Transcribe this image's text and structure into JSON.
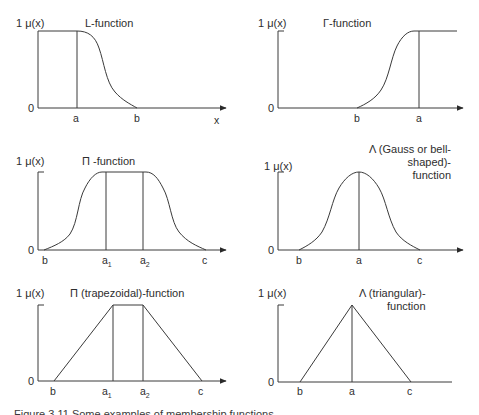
{
  "figure": {
    "caption": "Figure 3.11  Some examples of membership functions"
  },
  "panels": [
    {
      "id": "L",
      "title": "L-function",
      "y_label": "1 μ(x)",
      "zero_label": "0",
      "x_label": "x",
      "ticks": [
        "a",
        "b"
      ]
    },
    {
      "id": "Gamma",
      "title": "Γ-function",
      "y_label": "1 μ(x)",
      "zero_label": "0",
      "ticks": [
        "b",
        "a"
      ]
    },
    {
      "id": "Pi",
      "title": "Π -function",
      "y_label": "1 μ(x)",
      "zero_label": "0",
      "ticks": [
        "b",
        "a",
        "1",
        "a",
        "2",
        "c"
      ]
    },
    {
      "id": "Gauss",
      "title_lines": [
        "Λ (Gauss or bell-",
        "shaped)-",
        "function"
      ],
      "y_label": "1 μ(x)",
      "zero_label": "0",
      "ticks": [
        "b",
        "a",
        "c"
      ]
    },
    {
      "id": "Trapezoid",
      "title": "Π (trapezoidal)-function",
      "y_label": "1 μ(x)",
      "zero_label": "0",
      "ticks": [
        "b",
        "a",
        "1",
        "a",
        "2",
        "c"
      ]
    },
    {
      "id": "Triangle",
      "title_lines": [
        "Λ (triangular)-",
        "function"
      ],
      "y_label": "1 μ(x)",
      "zero_label": "0",
      "ticks": [
        "b",
        "a",
        "c"
      ]
    }
  ],
  "colors": {
    "ink": "#3a3a3a",
    "background": "#ffffff"
  }
}
